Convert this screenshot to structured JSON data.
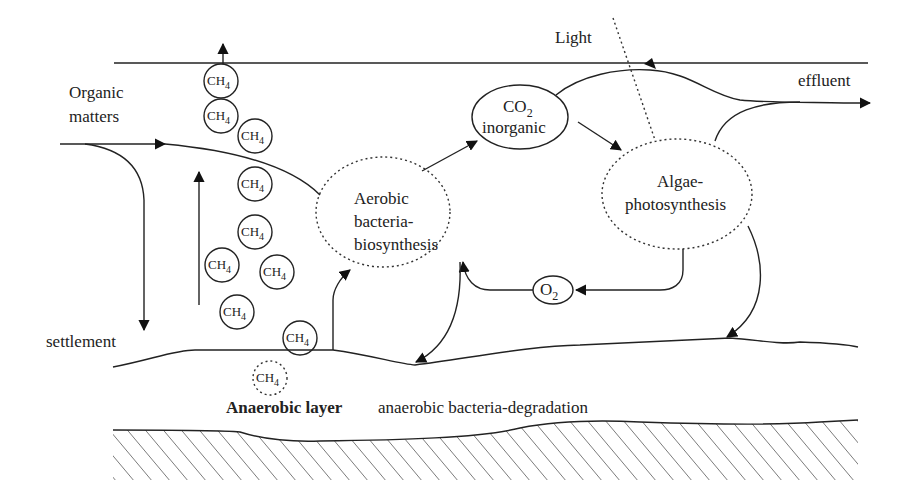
{
  "labels": {
    "organic_1": "Organic",
    "organic_2": "matters",
    "light": "Light",
    "effluent": "effluent",
    "settlement": "settlement",
    "co2_main": "CO",
    "co2_sub": "2",
    "co2_line2": "inorganic",
    "aerobic_1": "Aerobic",
    "aerobic_2": "bacteria-",
    "aerobic_3": "biosynthesis",
    "algae_1": "Algae-",
    "algae_2": "photosynthesis",
    "o2_main": "O",
    "o2_sub": "2",
    "anaerobic_bold": "Anaerobic layer",
    "anaerobic_desc": "anaerobic bacteria-degradation"
  },
  "methane": {
    "main": "CH",
    "sub": "4",
    "bubbles": [
      {
        "x": 221,
        "y": 81
      },
      {
        "x": 221,
        "y": 116
      },
      {
        "x": 255,
        "y": 136
      },
      {
        "x": 255,
        "y": 184
      },
      {
        "x": 255,
        "y": 232
      },
      {
        "x": 222,
        "y": 265
      },
      {
        "x": 277,
        "y": 272
      },
      {
        "x": 237,
        "y": 312
      },
      {
        "x": 300,
        "y": 338
      }
    ],
    "dashed_bubble": {
      "x": 270,
      "y": 378
    }
  }
}
